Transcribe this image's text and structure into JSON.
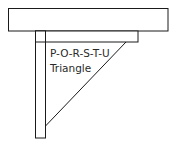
{
  "diagram": {
    "label_lines": [
      "P-O-R-S-T-U",
      "Triangle"
    ],
    "stroke_color": "#1a1a1a",
    "fill_color": "#ffffff",
    "parts": {
      "top_bar": {
        "x": 8,
        "y": 8,
        "width": 160,
        "height": 23
      },
      "inner_bar": {
        "x": 35,
        "y": 31,
        "width": 103,
        "height": 11
      },
      "post": {
        "x": 35,
        "y": 31,
        "width": 10,
        "height": 107
      },
      "brace_line": {
        "x1": 126,
        "y1": 42,
        "x2": 45,
        "y2": 126
      }
    }
  }
}
